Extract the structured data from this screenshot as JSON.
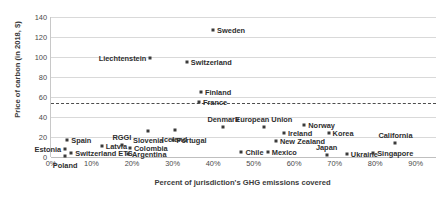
{
  "chart_data": {
    "type": "scatter",
    "title": "",
    "xlabel": "Percent of jurisdiction's GHG emissions covered",
    "ylabel": "Price of carbon (in 2018, $)",
    "xlim": [
      0,
      95
    ],
    "ylim": [
      0,
      140
    ],
    "ytick_step": 20,
    "xtick_step": 10,
    "grid": true,
    "legend": "none",
    "yticks": [
      "0",
      "20",
      "40",
      "60",
      "80",
      "100",
      "120",
      "140"
    ],
    "xticks": [
      "0%",
      "10%",
      "20%",
      "30%",
      "40%",
      "50%",
      "60%",
      "70%",
      "80%",
      "90%"
    ],
    "annotations": [
      {
        "name": "threshold-line",
        "type": "horizontal-dashed-line",
        "y": 54,
        "color": "#4d4d4d"
      }
    ],
    "points": [
      {
        "label": "Sweden",
        "x": 40.0,
        "y": 127,
        "lpos": "right"
      },
      {
        "label": "Liechtenstein",
        "x": 24.5,
        "y": 99,
        "lpos": "left"
      },
      {
        "label": "Switzerland",
        "x": 33.5,
        "y": 95,
        "lpos": "right"
      },
      {
        "label": "Finland",
        "x": 37.0,
        "y": 65,
        "lpos": "right"
      },
      {
        "label": "France",
        "x": 36.5,
        "y": 55,
        "lpos": "right"
      },
      {
        "label": "Denmark",
        "x": 42.5,
        "y": 30,
        "lpos": "above"
      },
      {
        "label": "European Union",
        "x": 52.5,
        "y": 30,
        "lpos": "above"
      },
      {
        "label": "Norway",
        "x": 62.5,
        "y": 32,
        "lpos": "right"
      },
      {
        "label": "Korea",
        "x": 68.5,
        "y": 24,
        "lpos": "right"
      },
      {
        "label": "California",
        "x": 85.0,
        "y": 14,
        "lpos": "above"
      },
      {
        "label": "Ireland",
        "x": 57.5,
        "y": 24,
        "lpos": "right"
      },
      {
        "label": "New Zealand",
        "x": 55.5,
        "y": 16,
        "lpos": "right"
      },
      {
        "label": "Slovenia",
        "x": 24.0,
        "y": 26,
        "lpos": "below"
      },
      {
        "label": "Iceland",
        "x": 30.5,
        "y": 27,
        "lpos": "below"
      },
      {
        "label": "Portugal",
        "x": 30.0,
        "y": 17,
        "lpos": "right"
      },
      {
        "label": "Spain",
        "x": 4.0,
        "y": 17,
        "lpos": "right"
      },
      {
        "label": "Estonia",
        "x": 3.5,
        "y": 8,
        "lpos": "left"
      },
      {
        "label": "Latvia",
        "x": 12.5,
        "y": 11,
        "lpos": "right"
      },
      {
        "label": "RGGI",
        "x": 17.5,
        "y": 12,
        "lpos": "above"
      },
      {
        "label": "Colombia",
        "x": 19.5,
        "y": 9,
        "lpos": "right"
      },
      {
        "label": "Argentina",
        "x": 19.0,
        "y": 3,
        "lpos": "right"
      },
      {
        "label": "Poland",
        "x": 3.5,
        "y": 1,
        "lpos": "below"
      },
      {
        "label": "Switzerland ETS",
        "x": 5.0,
        "y": 4,
        "lpos": "right"
      },
      {
        "label": "Chile",
        "x": 47.0,
        "y": 5,
        "lpos": "right"
      },
      {
        "label": "Mexico",
        "x": 53.5,
        "y": 5,
        "lpos": "right"
      },
      {
        "label": "Japan",
        "x": 68.0,
        "y": 2,
        "lpos": "above"
      },
      {
        "label": "Ukraine",
        "x": 73.0,
        "y": 3,
        "lpos": "right"
      },
      {
        "label": "Singapore",
        "x": 79.5,
        "y": 4,
        "lpos": "right"
      }
    ]
  }
}
